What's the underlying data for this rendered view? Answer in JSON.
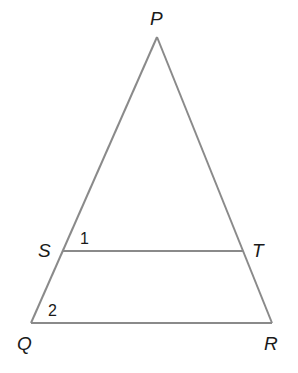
{
  "diagram": {
    "type": "triangle",
    "points": {
      "P": {
        "label": "P",
        "x": 157,
        "y": 37
      },
      "Q": {
        "label": "Q",
        "x": 31,
        "y": 323
      },
      "R": {
        "label": "R",
        "x": 272,
        "y": 323
      },
      "S": {
        "label": "S",
        "x": 63,
        "y": 251
      },
      "T": {
        "label": "T",
        "x": 243,
        "y": 251
      }
    },
    "segments": [
      "PQ",
      "PR",
      "QR",
      "ST"
    ],
    "angles": [
      {
        "label": "1",
        "at": "S"
      },
      {
        "label": "2",
        "at": "Q"
      }
    ],
    "line_color": "#8a8a8a",
    "text_color": "#1a1a1a"
  }
}
